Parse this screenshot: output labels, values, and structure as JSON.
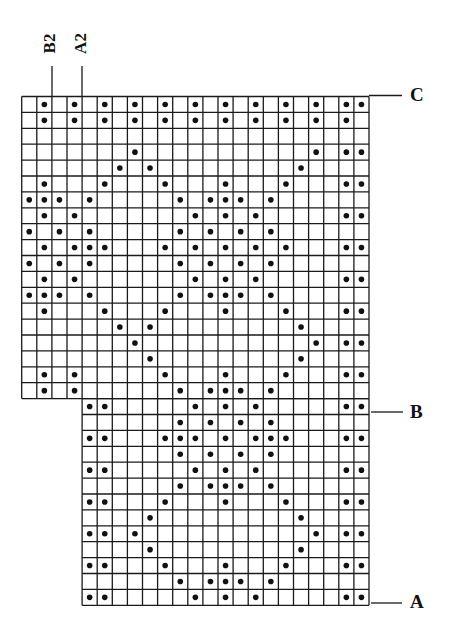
{
  "diagram": {
    "type": "knitting-chart",
    "grid": {
      "x0": 21.7,
      "y0": 96.5,
      "cell_w": 15.1,
      "cell_h": 15.9,
      "total_cols": 23,
      "total_rows": 32,
      "upper_section": {
        "rows": [
          0,
          18
        ],
        "cols": [
          0,
          22
        ]
      },
      "lower_section": {
        "rows": [
          19,
          31
        ],
        "cols": [
          4,
          22
        ]
      },
      "line_color": "#1a1a1a",
      "dot_color": "#111111"
    },
    "dots": [
      [
        1,
        3,
        5,
        7,
        9,
        11,
        13,
        15,
        17,
        19,
        21,
        22
      ],
      [
        1,
        3,
        5,
        7,
        9,
        11,
        13,
        15,
        17,
        19,
        21
      ],
      [],
      [
        7,
        19,
        21,
        22
      ],
      [
        6,
        8,
        18
      ],
      [
        1,
        5,
        9,
        13,
        17,
        21,
        22
      ],
      [
        0,
        1,
        2,
        4,
        10,
        12,
        13,
        14,
        16
      ],
      [
        1,
        3,
        11,
        13,
        15,
        21,
        22
      ],
      [
        0,
        2,
        4,
        10,
        12,
        14,
        16
      ],
      [
        1,
        3,
        4,
        5,
        9,
        11,
        13,
        15,
        17,
        21,
        22
      ],
      [
        0,
        2,
        4,
        10,
        12,
        14,
        16
      ],
      [
        1,
        3,
        11,
        13,
        15,
        21,
        22
      ],
      [
        0,
        1,
        2,
        4,
        10,
        12,
        13,
        14,
        16
      ],
      [
        1,
        5,
        9,
        13,
        17,
        21,
        22
      ],
      [
        6,
        8,
        18
      ],
      [
        7,
        19,
        21,
        22
      ],
      [
        8,
        18
      ],
      [
        1,
        3,
        9,
        13,
        17,
        21,
        22
      ],
      [
        1,
        3,
        10,
        12,
        13,
        14,
        16
      ],
      [
        4,
        5,
        11,
        13,
        15,
        21,
        22
      ],
      [
        10,
        12,
        14,
        16
      ],
      [
        4,
        5,
        9,
        10,
        11,
        13,
        15,
        16,
        17,
        21,
        22
      ],
      [
        10,
        12,
        14,
        16
      ],
      [
        4,
        5,
        11,
        13,
        15,
        21,
        22
      ],
      [
        10,
        12,
        13,
        14,
        16
      ],
      [
        4,
        5,
        9,
        13,
        17,
        21,
        22
      ],
      [
        8,
        18
      ],
      [
        4,
        5,
        7,
        19,
        21,
        22
      ],
      [
        8,
        18
      ],
      [
        4,
        5,
        9,
        13,
        17,
        21,
        22
      ],
      [
        10,
        12,
        13,
        14,
        16
      ],
      [
        4,
        5,
        11,
        13,
        15,
        21,
        22
      ]
    ],
    "side_markers": [
      {
        "label": "C",
        "y": 95.5,
        "x1": 369,
        "x2": 402
      },
      {
        "label": "B",
        "y": 412,
        "x1": 371,
        "x2": 403
      },
      {
        "label": "A",
        "y": 603,
        "x1": 371,
        "x2": 402
      }
    ],
    "top_markers": [
      {
        "label": "B2",
        "x": 52,
        "y1": 66,
        "y2": 97
      },
      {
        "label": "A2",
        "x": 82,
        "y1": 66,
        "y2": 97
      }
    ]
  },
  "labels": {
    "c": "C",
    "b": "B",
    "a": "A",
    "b2": "B2",
    "a2": "A2"
  }
}
